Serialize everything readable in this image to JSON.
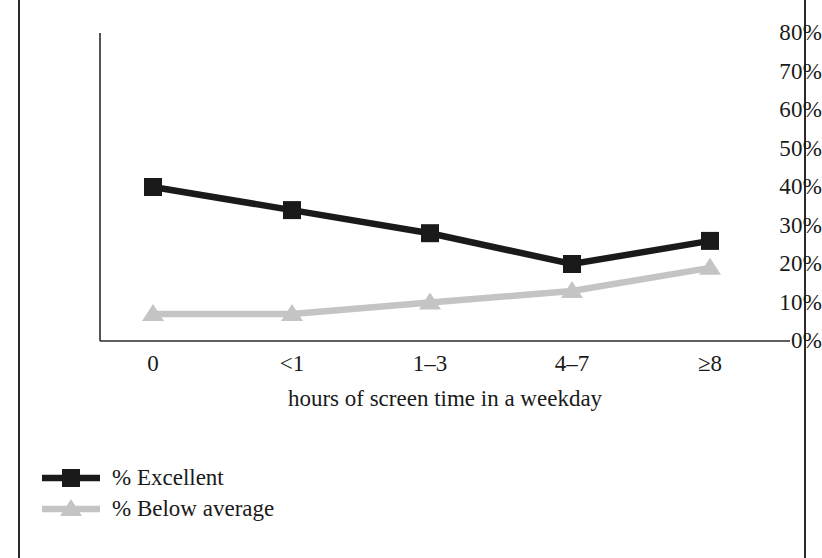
{
  "chart_data": {
    "type": "line",
    "title": "",
    "subtitle": "",
    "xlabel": "hours of screen time in a weekday",
    "ylabel": "",
    "categories": [
      "0",
      "<1",
      "1–3",
      "4–7",
      "≥8"
    ],
    "ylim": [
      0,
      80
    ],
    "ytick_values": [
      0,
      10,
      20,
      30,
      40,
      50,
      60,
      70,
      80
    ],
    "ytick_labels": [
      "0%",
      "10%",
      "20%",
      "30%",
      "40%",
      "50%",
      "60%",
      "70%",
      "80%"
    ],
    "grid": false,
    "legend_position": "bottom-left",
    "series": [
      {
        "name": "% Excellent",
        "values": [
          40,
          34,
          28,
          20,
          26
        ],
        "color": "#1a1a1a",
        "marker": "square"
      },
      {
        "name": "% Below average",
        "values": [
          7,
          7,
          10,
          13,
          19
        ],
        "color": "#c4c4c4",
        "marker": "triangle"
      }
    ]
  },
  "legend": {
    "items": [
      {
        "label": "% Excellent",
        "color": "#1a1a1a",
        "marker": "square"
      },
      {
        "label": "% Below average",
        "color": "#c4c4c4",
        "marker": "triangle"
      }
    ]
  },
  "axes": {
    "axis_color": "#2a2a2a"
  },
  "frame": {
    "border_color": "#2a2a2a"
  }
}
